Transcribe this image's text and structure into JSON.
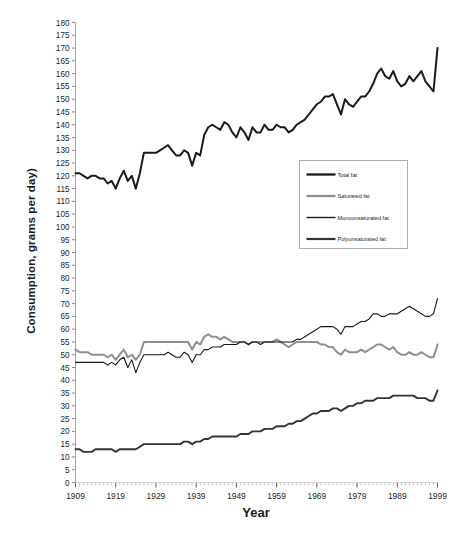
{
  "chart_data": {
    "type": "line",
    "title": "",
    "xlabel": "Year",
    "ylabel": "Consumption, grams per day)",
    "xlim": [
      1909,
      1999
    ],
    "ylim": [
      0,
      180
    ],
    "ytick_step": 5,
    "xtick_step": 10,
    "grid": false,
    "legend_position": "center-right",
    "yticks": [
      180,
      175,
      170,
      165,
      160,
      155,
      150,
      145,
      140,
      135,
      130,
      125,
      120,
      115,
      110,
      105,
      100,
      95,
      90,
      85,
      80,
      75,
      70,
      65,
      60,
      55,
      50,
      45,
      40,
      35,
      30,
      25,
      20,
      15,
      10,
      5,
      0
    ],
    "xticks": [
      1909,
      1919,
      1929,
      1939,
      1949,
      1959,
      1969,
      1979,
      1989,
      1999
    ],
    "x": [
      1909,
      1910,
      1911,
      1912,
      1913,
      1914,
      1915,
      1916,
      1917,
      1918,
      1919,
      1920,
      1921,
      1922,
      1923,
      1924,
      1925,
      1926,
      1927,
      1928,
      1929,
      1930,
      1931,
      1932,
      1933,
      1934,
      1935,
      1936,
      1937,
      1938,
      1939,
      1940,
      1941,
      1942,
      1943,
      1944,
      1945,
      1946,
      1947,
      1948,
      1949,
      1950,
      1951,
      1952,
      1953,
      1954,
      1955,
      1956,
      1957,
      1958,
      1959,
      1960,
      1961,
      1962,
      1963,
      1964,
      1965,
      1966,
      1967,
      1968,
      1969,
      1970,
      1971,
      1972,
      1973,
      1974,
      1975,
      1976,
      1977,
      1978,
      1979,
      1980,
      1981,
      1982,
      1983,
      1984,
      1985,
      1986,
      1987,
      1988,
      1989,
      1990,
      1991,
      1992,
      1993,
      1994,
      1995,
      1996,
      1997,
      1998,
      1999
    ],
    "series": [
      {
        "name": "Total fat",
        "color": "#1a1a1a",
        "width": 2.0,
        "values": [
          121,
          121,
          120,
          119,
          120,
          120,
          119,
          119,
          117,
          118,
          115,
          119,
          122,
          118,
          120,
          115,
          121,
          129,
          129,
          129,
          129,
          130,
          131,
          132,
          130,
          128,
          128,
          130,
          129,
          124,
          129,
          128,
          136,
          139,
          140,
          139,
          138,
          141,
          140,
          137,
          135,
          139,
          137,
          134,
          139,
          137,
          137,
          140,
          138,
          138,
          140,
          139,
          139,
          137,
          138,
          140,
          141,
          142,
          144,
          146,
          148,
          149,
          151,
          151,
          152,
          148,
          144,
          150,
          148,
          147,
          149,
          151,
          151,
          153,
          156,
          160,
          162,
          159,
          158,
          161,
          157,
          155,
          156,
          159,
          157,
          159,
          161,
          157,
          155,
          153,
          170
        ]
      },
      {
        "name": "Saturated fat",
        "color": "#8f8f8f",
        "width": 2.0,
        "values": [
          52,
          51,
          51,
          51,
          50,
          50,
          50,
          50,
          49,
          50,
          48,
          50,
          52,
          49,
          50,
          48,
          50,
          55,
          55,
          55,
          55,
          55,
          55,
          55,
          55,
          55,
          55,
          55,
          55,
          52,
          55,
          54,
          57,
          58,
          57,
          57,
          56,
          57,
          56,
          55,
          55,
          55,
          55,
          54,
          55,
          55,
          55,
          55,
          55,
          55,
          56,
          55,
          54,
          53,
          54,
          55,
          55,
          55,
          55,
          55,
          55,
          54,
          54,
          53,
          53,
          51,
          50,
          52,
          51,
          51,
          51,
          52,
          51,
          52,
          53,
          54,
          54,
          53,
          52,
          53,
          51,
          50,
          50,
          51,
          50,
          50,
          51,
          50,
          49,
          49,
          54
        ]
      },
      {
        "name": "Monounsaturated fat",
        "color": "#1a1a1a",
        "width": 1.1,
        "values": [
          47,
          47,
          47,
          47,
          47,
          47,
          47,
          47,
          46,
          47,
          46,
          48,
          49,
          45,
          48,
          43,
          47,
          50,
          50,
          50,
          50,
          50,
          50,
          51,
          50,
          49,
          49,
          51,
          50,
          47,
          50,
          50,
          52,
          52,
          53,
          53,
          53,
          54,
          54,
          54,
          54,
          55,
          55,
          54,
          55,
          55,
          54,
          55,
          55,
          55,
          55,
          55,
          55,
          55,
          55,
          56,
          56,
          57,
          58,
          59,
          60,
          61,
          61,
          61,
          61,
          60,
          58,
          61,
          61,
          61,
          62,
          63,
          63,
          64,
          66,
          66,
          65,
          65,
          66,
          66,
          66,
          67,
          68,
          69,
          68,
          67,
          66,
          65,
          65,
          66,
          72
        ]
      },
      {
        "name": "Polyunsaturated fat",
        "color": "#333333",
        "width": 1.9,
        "values": [
          13,
          13,
          12,
          12,
          12,
          13,
          13,
          13,
          13,
          13,
          12,
          13,
          13,
          13,
          13,
          13,
          14,
          15,
          15,
          15,
          15,
          15,
          15,
          15,
          15,
          15,
          15,
          16,
          16,
          15,
          16,
          16,
          17,
          17,
          18,
          18,
          18,
          18,
          18,
          18,
          18,
          19,
          19,
          19,
          20,
          20,
          20,
          21,
          21,
          21,
          22,
          22,
          22,
          23,
          23,
          24,
          24,
          25,
          26,
          27,
          27,
          28,
          28,
          28,
          29,
          29,
          28,
          29,
          30,
          30,
          31,
          31,
          32,
          32,
          32,
          33,
          33,
          33,
          33,
          34,
          34,
          34,
          34,
          34,
          34,
          33,
          33,
          33,
          32,
          32,
          36
        ]
      }
    ]
  },
  "legend": {
    "items": [
      {
        "label": "Total fat"
      },
      {
        "label": "Saturated fat"
      },
      {
        "label": "Monounsaturated fat"
      },
      {
        "label": "Polyunsaturated fat"
      }
    ]
  }
}
